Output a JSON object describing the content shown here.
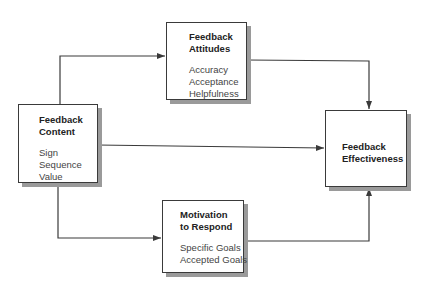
{
  "diagram": {
    "nodes": [
      {
        "id": "content",
        "title": "Feedback\nContent",
        "items": [
          "Sign",
          "Sequence",
          "Value"
        ]
      },
      {
        "id": "attitudes",
        "title": "Feedback\nAttitudes",
        "items": [
          "Accuracy",
          "Acceptance",
          "Helpfulness"
        ]
      },
      {
        "id": "motivation",
        "title": "Motivation\nto Respond",
        "items": [
          "Specific Goals",
          "Accepted Goals"
        ]
      },
      {
        "id": "effectiveness",
        "title": "Feedback\nEffectiveness",
        "items": []
      }
    ],
    "edges": [
      {
        "from": "content",
        "to": "attitudes"
      },
      {
        "from": "content",
        "to": "effectiveness"
      },
      {
        "from": "content",
        "to": "motivation"
      },
      {
        "from": "attitudes",
        "to": "effectiveness"
      },
      {
        "from": "motivation",
        "to": "effectiveness"
      }
    ],
    "colors": {
      "line": "#3a3a3a",
      "shadow": "#9a9a9a",
      "background": "#ffffff"
    }
  }
}
